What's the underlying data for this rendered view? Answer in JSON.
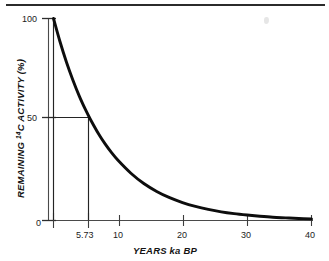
{
  "figure": {
    "top_rule": "horizontal-rule",
    "artifact": "scan-smudge"
  },
  "chart_data": {
    "type": "line",
    "title": "",
    "xlabel": "YEARS ka BP",
    "ylabel_parts": {
      "lead": "REMAINING ",
      "superscript": "14",
      "trail": "C ACTIVITY (%)"
    },
    "ylabel": "REMAINING 14C ACTIVITY (%)",
    "xlim": [
      0,
      40
    ],
    "ylim": [
      0,
      100
    ],
    "grid": false,
    "legend": "none",
    "xticks": [
      0,
      5.73,
      10,
      20,
      30,
      40
    ],
    "xtick_labels": [
      "0",
      "5.73",
      "10",
      "20",
      "30",
      "40"
    ],
    "yticks": [
      0,
      50,
      100
    ],
    "ytick_labels": [
      "0",
      "50",
      "100"
    ],
    "curve_label": "14C exponential decay",
    "half_life_ka": 5.73,
    "x": [
      0,
      1,
      2,
      3,
      4,
      5,
      5.73,
      7,
      8,
      9,
      10,
      12,
      14,
      16,
      18,
      20,
      22,
      24,
      26,
      28,
      30,
      32,
      34,
      36,
      38,
      40
    ],
    "values": [
      100,
      88.6,
      78.5,
      69.6,
      61.6,
      54.6,
      50,
      42.8,
      37.9,
      33.6,
      29.8,
      23.4,
      18.3,
      14.4,
      11.3,
      8.9,
      7.0,
      5.5,
      4.3,
      3.4,
      2.7,
      2.1,
      1.6,
      1.3,
      1.0,
      0.8
    ],
    "annotations": [
      {
        "name": "half-life-horizontal-guide",
        "from": [
          0,
          50
        ],
        "to": [
          5.73,
          50
        ]
      },
      {
        "name": "half-life-vertical-guide",
        "from": [
          5.73,
          50
        ],
        "to": [
          5.73,
          0
        ]
      },
      {
        "name": "origin-vertical-guide",
        "from": [
          0,
          100
        ],
        "to": [
          0,
          0
        ]
      }
    ],
    "colors": {
      "curve": "#0d0d0d",
      "axis": "#4a4a4a",
      "guide": "#242424",
      "background": "#ffffff",
      "rule": "#2b2b2b"
    }
  }
}
